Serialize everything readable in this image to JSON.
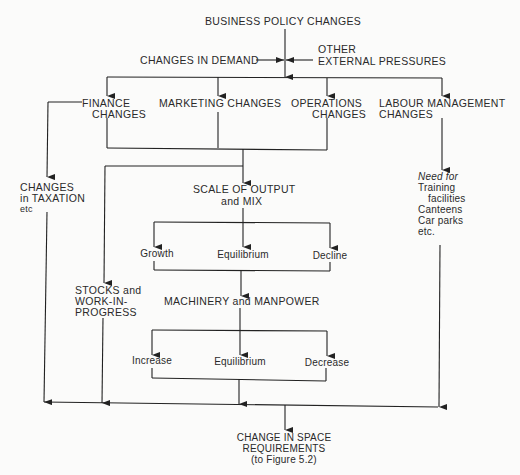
{
  "diagram": {
    "title": "BUSINESS POLICY CHANGES",
    "inputs": {
      "left": "CHANGES IN DEMAND",
      "right_line1": "OTHER",
      "right_line2": "EXTERNAL PRESSURES"
    },
    "branches": {
      "finance": [
        "FINANCE",
        "CHANGES"
      ],
      "marketing": "MARKETING CHANGES",
      "operations": [
        "OPERATIONS",
        "CHANGES"
      ],
      "labour": [
        "LABOUR MANAGEMENT",
        "CHANGES"
      ]
    },
    "taxation": [
      "CHANGES",
      "in TAXATION",
      "etc"
    ],
    "labour_needs": {
      "heading": "Need for",
      "items": [
        "Training",
        "facilities",
        "Canteens",
        "Car parks",
        "etc."
      ]
    },
    "scale": [
      "SCALE OF OUTPUT",
      "and MIX"
    ],
    "scale_outcomes": [
      "Growth",
      "Equilibrium",
      "Decline"
    ],
    "stocks": [
      "STOCKS and",
      "WORK-IN-",
      "PROGRESS"
    ],
    "machinery": "MACHINERY and MANPOWER",
    "machinery_outcomes": [
      "Increase",
      "Equilibrium",
      "Decrease"
    ],
    "result": [
      "CHANGE IN SPACE",
      "REQUIREMENTS",
      "(to Figure 5.2)"
    ]
  }
}
